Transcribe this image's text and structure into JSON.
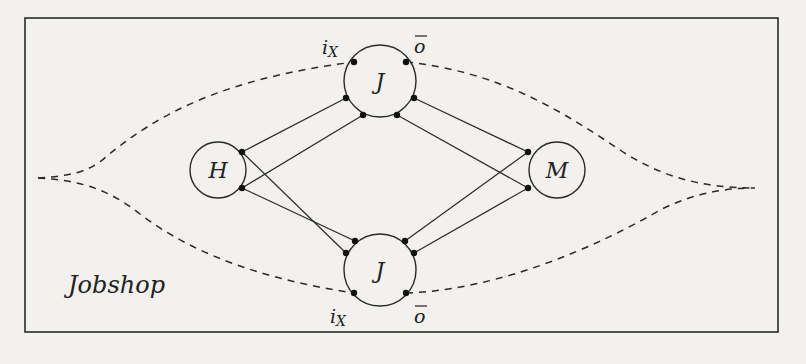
{
  "diagram": {
    "title": "Jobshop",
    "colors": {
      "ink": "#2a2a2a",
      "background": "#f2f1ee"
    },
    "nodes": [
      {
        "id": "J_top",
        "label": "J",
        "cx": 380,
        "cy": 81,
        "r": 36
      },
      {
        "id": "J_bottom",
        "label": "J",
        "cx": 380,
        "cy": 270,
        "r": 36
      },
      {
        "id": "H",
        "label": "H",
        "cx": 218,
        "cy": 170,
        "r": 28
      },
      {
        "id": "M",
        "label": "M",
        "cx": 557,
        "cy": 170,
        "r": 28
      }
    ],
    "port_labels": {
      "top_input": "i",
      "top_input_sub": "X",
      "top_output": "o",
      "bottom_input": "i",
      "bottom_input_sub": "X",
      "bottom_output": "o"
    },
    "edges": [
      {
        "from": "H",
        "to": "J_top",
        "type": "solid"
      },
      {
        "from": "H",
        "to": "J_top",
        "type": "solid"
      },
      {
        "from": "H",
        "to": "J_bottom",
        "type": "solid"
      },
      {
        "from": "H",
        "to": "J_bottom",
        "type": "solid"
      },
      {
        "from": "J_top",
        "to": "M",
        "type": "solid"
      },
      {
        "from": "J_top",
        "to": "M",
        "type": "solid"
      },
      {
        "from": "J_bottom",
        "to": "M",
        "type": "solid"
      },
      {
        "from": "J_bottom",
        "to": "M",
        "type": "solid"
      },
      {
        "from": "left-boundary",
        "to": "J_top.i",
        "type": "dashed"
      },
      {
        "from": "J_top.o",
        "to": "right-boundary",
        "type": "dashed"
      },
      {
        "from": "left-boundary",
        "to": "J_bottom.i",
        "type": "dashed"
      },
      {
        "from": "J_bottom.o",
        "to": "right-boundary",
        "type": "dashed"
      }
    ]
  }
}
